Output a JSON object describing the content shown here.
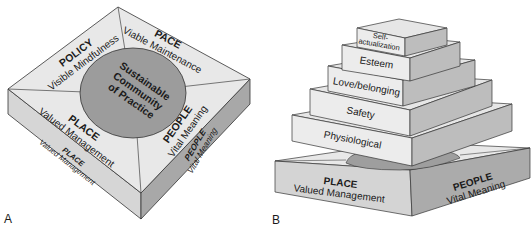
{
  "figure_a": {
    "label": "A",
    "center": [
      "Sustainable",
      "Community",
      "of Practice"
    ],
    "quadrants": {
      "top_left": {
        "title": "POLICY",
        "subtitle": "Visible Mindfulness"
      },
      "top_right": {
        "title": "PACE",
        "subtitle": "Viable Maintenance"
      },
      "bottom_left": {
        "title": "PLACE",
        "subtitle": "Valued Management"
      },
      "bottom_right": {
        "title": "PEOPLE",
        "subtitle": "Vital Meaning"
      }
    },
    "side_faces": {
      "left": {
        "title": "PLACE",
        "subtitle": "Valued Management"
      },
      "right": {
        "title": "PEOPLE",
        "subtitle": "Vital Meaning"
      }
    }
  },
  "figure_b": {
    "label": "B",
    "tiers": [
      {
        "label": [
          "Self-",
          "actualization"
        ]
      },
      {
        "label": [
          "Esteem"
        ]
      },
      {
        "label": [
          "Love/belonging"
        ]
      },
      {
        "label": [
          "Safety"
        ]
      },
      {
        "label": [
          "Physiological"
        ]
      }
    ],
    "base_faces": {
      "left": {
        "title": "PLACE",
        "subtitle": "Valued Management"
      },
      "right": {
        "title": "PEOPLE",
        "subtitle": "Vital Meaning"
      }
    }
  },
  "colors": {
    "top_face": "#e6e6e6",
    "left_face": "#d4d4d4",
    "right_face": "#a9a9a9",
    "circle": "#9a9a9a",
    "stroke": "#333333"
  }
}
